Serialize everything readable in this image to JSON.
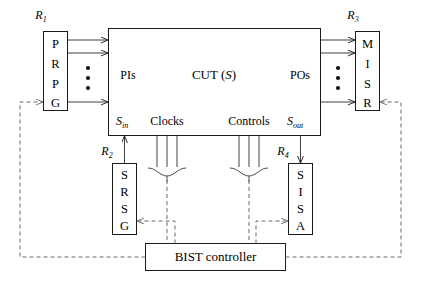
{
  "figure": {
    "background": "#ffffff",
    "line_color": "#1a1a1a",
    "dashed_color": "#6a6a6a"
  },
  "registers": {
    "r1": {
      "tag": "R",
      "tag_sub": "1",
      "letters": [
        "P",
        "R",
        "P",
        "G"
      ],
      "name": "PRPG"
    },
    "r2": {
      "tag": "R",
      "tag_sub": "2",
      "letters": [
        "S",
        "R",
        "S",
        "G"
      ],
      "name": "SRSG"
    },
    "r3": {
      "tag": "R",
      "tag_sub": "3",
      "letters": [
        "M",
        "I",
        "S",
        "R"
      ],
      "name": "MISR"
    },
    "r4": {
      "tag": "R",
      "tag_sub": "4",
      "letters": [
        "S",
        "I",
        "S",
        "A"
      ],
      "name": "SISA"
    }
  },
  "cut": {
    "label_main": "CUT (",
    "label_italic": "S",
    "label_close": ")",
    "pis": "PIs",
    "pos": "POs",
    "s_in": "S",
    "s_in_sub": "in",
    "s_out": "S",
    "s_out_sub": "out",
    "clocks": "Clocks",
    "controls": "Controls"
  },
  "controller": {
    "label": "BIST controller"
  },
  "bus_dots": {
    "count": 3
  }
}
